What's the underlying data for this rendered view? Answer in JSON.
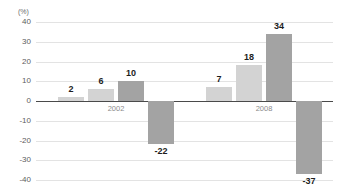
{
  "chart_data": {
    "type": "bar",
    "title": "",
    "subtitle": "",
    "xlabel": "",
    "ylabel": "",
    "unit_label": "(%)",
    "ylim": [
      -40,
      40
    ],
    "ytick_step": 10,
    "yticks": [
      "40",
      "30",
      "20",
      "10",
      "0",
      "-10",
      "-20",
      "-30",
      "-40"
    ],
    "ytick_values": [
      40,
      30,
      20,
      10,
      0,
      -10,
      -20,
      -30,
      -40
    ],
    "grid": true,
    "legend": "none",
    "categories": [
      "2002",
      "2008"
    ],
    "groups": [
      {
        "label": "2002",
        "bars": [
          {
            "value": 2,
            "label": "2",
            "color": "#d3d3d3",
            "shade": "light"
          },
          {
            "value": 6,
            "label": "6",
            "color": "#d3d3d3",
            "shade": "light"
          },
          {
            "value": 10,
            "label": "10",
            "color": "#a3a3a3",
            "shade": "dark"
          },
          {
            "value": -22,
            "label": "-22",
            "color": "#a3a3a3",
            "shade": "dark"
          }
        ]
      },
      {
        "label": "2008",
        "bars": [
          {
            "value": 7,
            "label": "7",
            "color": "#d3d3d3",
            "shade": "light"
          },
          {
            "value": 18,
            "label": "18",
            "color": "#d3d3d3",
            "shade": "light"
          },
          {
            "value": 34,
            "label": "34",
            "color": "#a3a3a3",
            "shade": "dark"
          },
          {
            "value": -37,
            "label": "-37",
            "color": "#a3a3a3",
            "shade": "dark"
          }
        ]
      }
    ],
    "colors": {
      "light_bar": "#d3d3d3",
      "dark_bar": "#a3a3a3",
      "gridline": "#e3e3e3",
      "zero_axis": "#4a4a4a",
      "tick_text": "#5d5d5d",
      "value_text": "#1d1d1d",
      "group_text": "#8a8a8a",
      "background": "#ffffff"
    }
  }
}
